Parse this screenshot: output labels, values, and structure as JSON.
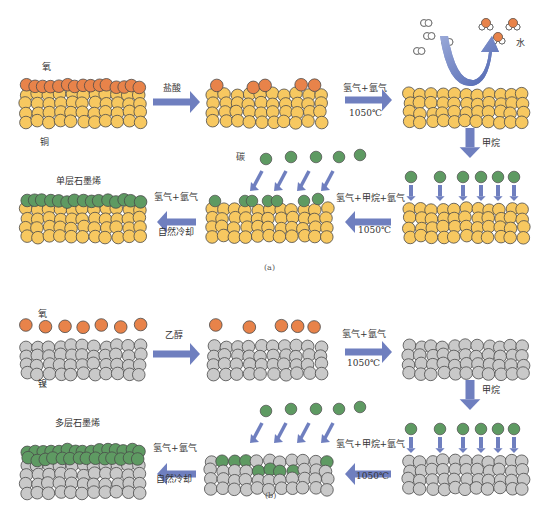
{
  "panels": {
    "a": {
      "caption": "(a)",
      "substrate_label": "铜",
      "oxide_label": "氧",
      "water_label": "水",
      "carbon_label": "碳",
      "product_label": "单层石墨烯",
      "steps": {
        "step1_label": "盐酸",
        "step2_label_top": "氢气+氩气",
        "step2_label_bottom": "1050℃",
        "step3_label": "甲烷",
        "step4_label_top": "氢气+甲烷+氩气",
        "step4_label_bottom": "1050℃",
        "step5_label_top": "氢气+氩气",
        "step5_label_bottom": "自然冷却"
      }
    },
    "b": {
      "caption": "(b)",
      "substrate_label": "镍",
      "oxide_label": "氧",
      "product_label": "多层石墨烯",
      "steps": {
        "step1_label": "乙醇",
        "step2_label_top": "氢气+氩气",
        "step2_label_bottom": "1050℃",
        "step3_label": "甲烷",
        "step4_label_top": "氢气+甲烷+氩气",
        "step4_label_bottom": "1050℃",
        "step5_label_top": "氢气+氩气",
        "step5_label_bottom": "自然冷却"
      }
    }
  },
  "colors": {
    "copper": "#f7c860",
    "nickel": "#c9c9c9",
    "oxygen": "#e8834a",
    "carbon": "#5e9a62",
    "arrow": "#6f7fbf",
    "outline": "#4a4a4a"
  }
}
